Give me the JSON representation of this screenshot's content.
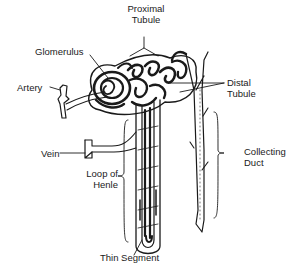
{
  "diagram": {
    "labels": {
      "proximal_tubule": [
        "Proximal",
        "Tubule"
      ],
      "glomerulus": "Glomerulus",
      "artery": "Artery",
      "distal_tubule": [
        "Distal",
        "Tubule"
      ],
      "vein": "Vein",
      "loop_of_henle": [
        "Loop of",
        "Henle"
      ],
      "collecting_duct": [
        "Collecting",
        "Duct"
      ],
      "thin_segment": "Thin Segment"
    },
    "colors": {
      "line": "#1a1a1a",
      "background": "#ffffff"
    }
  }
}
